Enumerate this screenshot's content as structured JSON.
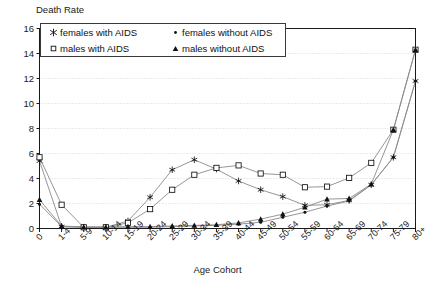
{
  "chart_data": {
    "type": "line",
    "title": "",
    "ylabel": "Death Rate",
    "xlabel": "Age Cohort",
    "ylim": [
      0,
      16
    ],
    "yticks": [
      0,
      2,
      4,
      6,
      8,
      10,
      12,
      14,
      16
    ],
    "grid": true,
    "grid_axis": "y",
    "legend_position": "top-left-inside",
    "categories": [
      "0",
      "1-4",
      "5-9",
      "10-14",
      "15-19",
      "20-24",
      "25-29",
      "30-34",
      "35-39",
      "40-44",
      "45-49",
      "50-54",
      "55-59",
      "60-64",
      "65-69",
      "70-74",
      "75-79",
      "80+"
    ],
    "series": [
      {
        "name": "females with AIDS",
        "marker": "star",
        "values": [
          5.4,
          0.15,
          0.1,
          0.1,
          0.6,
          2.5,
          4.7,
          5.5,
          4.75,
          3.8,
          3.1,
          2.55,
          1.85,
          1.9,
          2.25,
          3.5,
          5.7,
          11.8
        ]
      },
      {
        "name": "females without AIDS",
        "marker": "dot",
        "values": [
          1.95,
          0.15,
          0.1,
          0.1,
          0.1,
          0.1,
          0.15,
          0.2,
          0.25,
          0.35,
          0.5,
          0.9,
          1.3,
          1.8,
          2.2,
          3.5,
          5.7,
          11.8
        ]
      },
      {
        "name": "males with AIDS",
        "marker": "square",
        "values": [
          5.7,
          1.9,
          0.1,
          0.1,
          0.45,
          1.55,
          3.1,
          4.3,
          4.85,
          5.05,
          4.4,
          4.3,
          3.3,
          3.35,
          4.05,
          5.25,
          7.9,
          14.3
        ]
      },
      {
        "name": "males without AIDS",
        "marker": "triangle",
        "values": [
          2.3,
          0.2,
          0.12,
          0.12,
          0.15,
          0.15,
          0.2,
          0.25,
          0.3,
          0.45,
          0.75,
          1.15,
          1.7,
          2.35,
          2.4,
          3.55,
          7.9,
          14.3
        ]
      }
    ]
  },
  "legend": {
    "entries": [
      {
        "label": "females with AIDS",
        "marker": "star-marker"
      },
      {
        "label": "females without AIDS",
        "marker": "dot-marker"
      },
      {
        "label": "males with AIDS",
        "marker": "square-marker"
      },
      {
        "label": "males without AIDS",
        "marker": "triangle-marker"
      }
    ]
  },
  "colors": {
    "axis": "#1a1a1a",
    "grid": "#cccccc",
    "line": "#8a8a8a",
    "marker": "#111111",
    "background": "#ffffff"
  }
}
